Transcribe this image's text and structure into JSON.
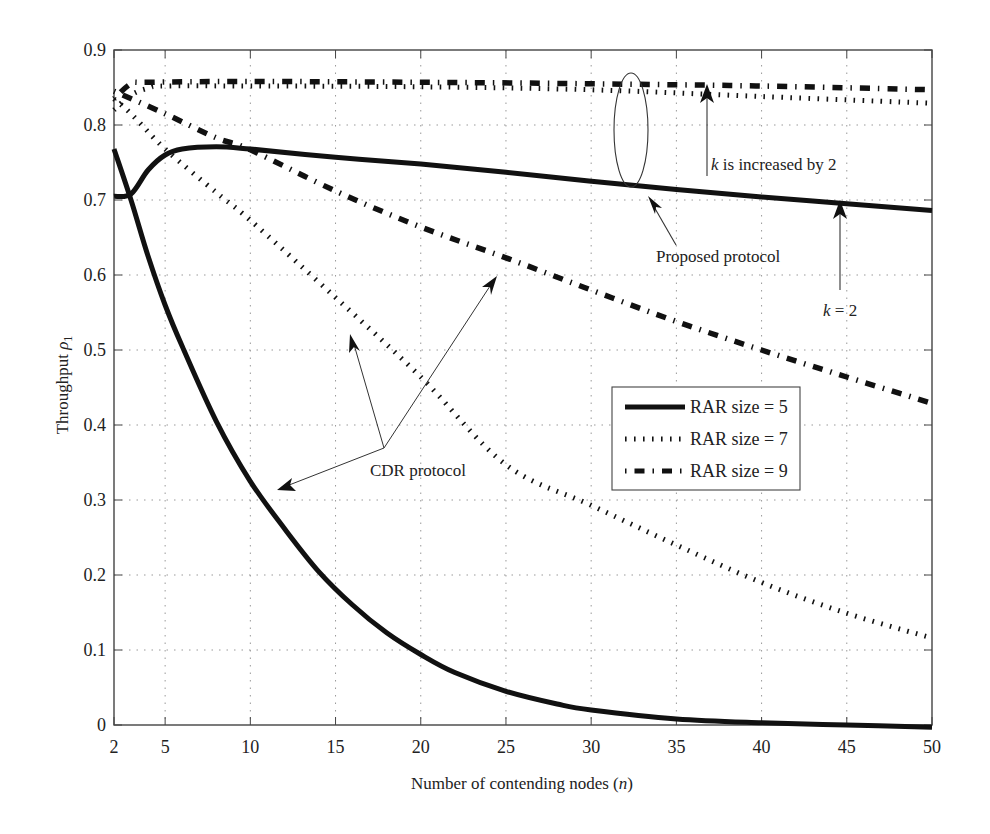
{
  "chart_data": {
    "type": "line",
    "title": "",
    "xlabel": "Number of contending nodes (n)",
    "xlabel_main": "Number of contending nodes (",
    "xlabel_var": "n",
    "xlabel_end": ")",
    "ylabel": "Throughput ρ1",
    "ylabel_main": "Throughput ",
    "ylabel_var": "ρ",
    "ylabel_sub": "1",
    "xlim": [
      2,
      50
    ],
    "ylim": [
      0,
      0.9
    ],
    "grid": true,
    "x_ticks": [
      2,
      5,
      10,
      15,
      20,
      25,
      30,
      35,
      40,
      45,
      50
    ],
    "y_ticks": [
      0,
      0.1,
      0.2,
      0.3,
      0.4,
      0.5,
      0.6,
      0.7,
      0.8,
      0.9
    ],
    "x_tick_labels": [
      "2",
      "5",
      "10",
      "15",
      "20",
      "25",
      "30",
      "35",
      "40",
      "45",
      "50"
    ],
    "y_tick_labels": [
      "0",
      "0.1",
      "0.2",
      "0.3",
      "0.4",
      "0.5",
      "0.6",
      "0.7",
      "0.8",
      "0.9"
    ],
    "legend": {
      "position": "center-right",
      "entries": [
        {
          "label": "RAR size = 5",
          "style": "solid"
        },
        {
          "label": "RAR size = 7",
          "style": "dotted"
        },
        {
          "label": "RAR size = 9",
          "style": "dashdot"
        }
      ]
    },
    "series": [
      {
        "name": "Proposed protocol, RAR size = 5",
        "style": "solid",
        "x": [
          2,
          3,
          4,
          5,
          6,
          8,
          10,
          15,
          20,
          25,
          30,
          35,
          40,
          45,
          50
        ],
        "values": [
          0.705,
          0.708,
          0.74,
          0.76,
          0.768,
          0.771,
          0.768,
          0.757,
          0.748,
          0.737,
          0.725,
          0.714,
          0.704,
          0.695,
          0.686
        ]
      },
      {
        "name": "CDR protocol, RAR size = 5",
        "style": "solid",
        "x": [
          2,
          3,
          4,
          5,
          6,
          8,
          10,
          12,
          14,
          16,
          18,
          20,
          22,
          25,
          28,
          30,
          35,
          40,
          45,
          50
        ],
        "values": [
          0.768,
          0.7,
          0.625,
          0.56,
          0.505,
          0.405,
          0.325,
          0.262,
          0.205,
          0.16,
          0.123,
          0.094,
          0.07,
          0.045,
          0.028,
          0.02,
          0.008,
          0.003,
          0.0,
          -0.003
        ]
      },
      {
        "name": "Proposed protocol, RAR size = 7",
        "style": "dotted",
        "x": [
          2,
          3,
          4,
          5,
          10,
          20,
          30,
          40,
          50
        ],
        "values": [
          0.82,
          0.84,
          0.849,
          0.852,
          0.852,
          0.851,
          0.847,
          0.838,
          0.829
        ]
      },
      {
        "name": "CDR protocol, RAR size = 7",
        "style": "dotted",
        "x": [
          2,
          3,
          5,
          8,
          10,
          15,
          20,
          25,
          30,
          35,
          40,
          45,
          50
        ],
        "values": [
          0.835,
          0.815,
          0.768,
          0.71,
          0.673,
          0.57,
          0.464,
          0.347,
          0.293,
          0.24,
          0.19,
          0.149,
          0.116
        ]
      },
      {
        "name": "Proposed protocol, RAR size = 9",
        "style": "dashdot",
        "x": [
          2,
          3,
          4,
          10,
          20,
          30,
          40,
          50
        ],
        "values": [
          0.835,
          0.855,
          0.857,
          0.858,
          0.857,
          0.855,
          0.852,
          0.847
        ]
      },
      {
        "name": "CDR protocol, RAR size = 9",
        "style": "dashdot",
        "x": [
          2,
          5,
          8,
          10,
          15,
          20,
          25,
          30,
          35,
          40,
          45,
          50
        ],
        "values": [
          0.845,
          0.815,
          0.783,
          0.767,
          0.712,
          0.664,
          0.623,
          0.58,
          0.538,
          0.5,
          0.464,
          0.429
        ]
      }
    ],
    "annotations": [
      {
        "id": "k-increased",
        "text_var": "k",
        "text": " is increased by 2"
      },
      {
        "id": "proposed",
        "text": "Proposed protocol"
      },
      {
        "id": "k2",
        "text_var": "k",
        "text": " = 2"
      },
      {
        "id": "cdr",
        "text": "CDR protocol"
      }
    ]
  }
}
